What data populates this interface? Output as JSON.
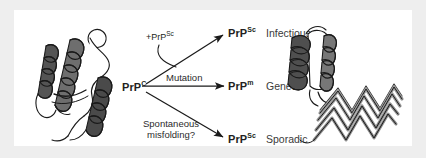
{
  "figure": {
    "source_label": "PrP conversion pathways diagram",
    "input": {
      "symbol": "PrP",
      "superscript": "C"
    },
    "pathways": [
      {
        "id": "infectious",
        "condition": "+PrP",
        "condition_superscript": "Sc",
        "arrow": "diagonal-up",
        "product_symbol": "PrP",
        "product_superscript": "Sc",
        "outcome": "Infectious"
      },
      {
        "id": "genetic",
        "condition": "Mutation",
        "condition_superscript": "",
        "arrow": "horizontal",
        "product_symbol": "PrP",
        "product_superscript": "m",
        "outcome": "Genetic"
      },
      {
        "id": "sporadic",
        "condition": "Spontaneous",
        "condition_line2": "misfolding?",
        "condition_superscript": "",
        "arrow": "diagonal-down",
        "product_symbol": "PrP",
        "product_superscript": "Sc",
        "outcome": "Sporadic"
      }
    ],
    "structures": [
      {
        "id": "prpc-structure",
        "name": "PrP-C cellular prion protein ribbon model"
      },
      {
        "id": "prpsc-structure",
        "name": "PrP-Sc scrapie prion protein beta-sheet ribbon model"
      }
    ],
    "colors": {
      "page_background": "#eeeeee",
      "panel_background": "#ffffff",
      "ink": "#231f20",
      "ribbon_dark": "#4a4a4a",
      "ribbon_mid": "#8a8a8a",
      "ribbon_light": "#c8c8c8"
    }
  }
}
